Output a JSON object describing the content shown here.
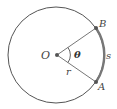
{
  "figure": {
    "type": "circle-sector-arc-length",
    "labels": {
      "center": "O",
      "point_b": "B",
      "point_a": "A",
      "angle": "θ",
      "radius": "r",
      "arc": "s"
    },
    "colors": {
      "circle": "#555555",
      "arc_highlight": "#777777",
      "point": "#555555",
      "text": "#444444"
    }
  }
}
